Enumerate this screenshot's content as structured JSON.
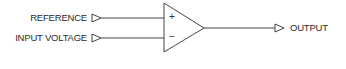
{
  "diagram": {
    "type": "comparator / op-amp schematic",
    "inputs": [
      {
        "label": "REFERENCE",
        "terminal": "+"
      },
      {
        "label": "INPUT VOLTAGE",
        "terminal": "−"
      }
    ],
    "output": {
      "label": "OUTPUT"
    },
    "signs": {
      "plus": "+",
      "minus": "−"
    },
    "colors": {
      "stroke": "#333333",
      "text": "#2a2a2a",
      "background": "#ffffff"
    }
  }
}
